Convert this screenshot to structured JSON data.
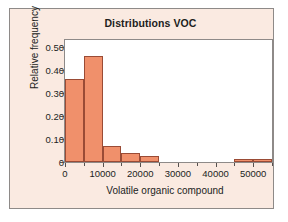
{
  "chart_data": {
    "type": "bar",
    "title": "Distributions VOC",
    "xlabel": "Volatile organic compound",
    "ylabel": "Relative frequency",
    "xlim": [
      0,
      55000
    ],
    "ylim": [
      0,
      0.53
    ],
    "grid": false,
    "legend": null,
    "bin_width": 5000,
    "bin_edges": [
      0,
      5000,
      10000,
      15000,
      20000,
      25000,
      30000,
      35000,
      40000,
      45000,
      50000,
      55000
    ],
    "values": [
      0.36,
      0.46,
      0.07,
      0.04,
      0.025,
      0,
      0,
      0,
      0,
      0.013,
      0.013
    ],
    "categories": [
      "0-5000",
      "5000-10000",
      "10000-15000",
      "15000-20000",
      "20000-25000",
      "25000-30000",
      "30000-35000",
      "35000-40000",
      "40000-45000",
      "45000-50000",
      "50000-55000"
    ],
    "xticks": [
      0,
      10000,
      20000,
      30000,
      40000,
      50000
    ],
    "xtick_labels": [
      "0",
      "10000",
      "20000",
      "30000",
      "40000",
      "50000"
    ],
    "yticks": [
      0,
      0.1,
      0.2,
      0.3,
      0.4,
      0.5
    ],
    "ytick_labels": [
      "0",
      "0.10",
      "0.20",
      "0.30",
      "0.40",
      "0.50"
    ],
    "colors": {
      "bar_fill": "#f0906b",
      "bar_edge": "#9a4b35",
      "panel_background": "#faeae1",
      "plot_background": "#ffffff",
      "frame": "#8e8a88",
      "text": "#211d1c"
    }
  }
}
